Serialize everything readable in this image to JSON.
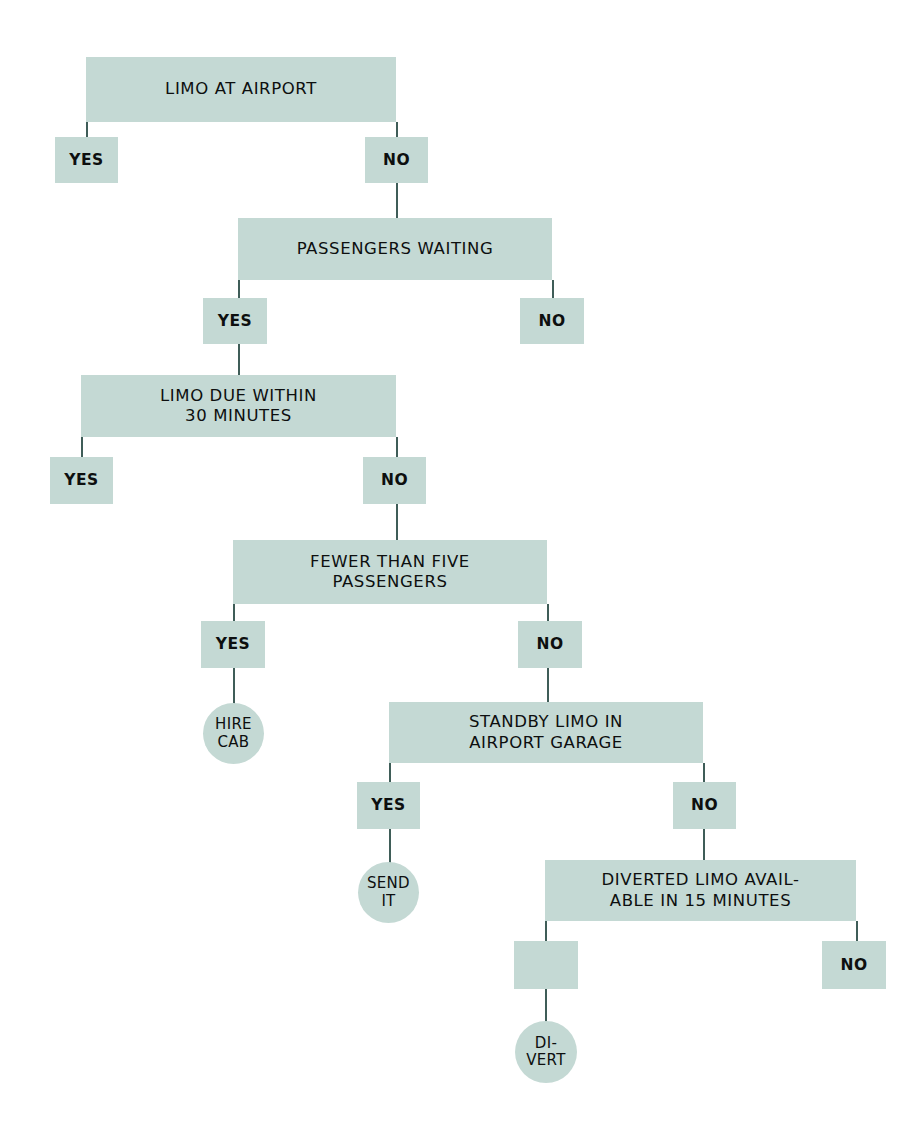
{
  "diagram": {
    "colors": {
      "node_fill": "#c4d9d4",
      "connector": "#3f5d58",
      "text": "#0d0f0f",
      "background": "#ffffff"
    },
    "nodes": [
      {
        "id": "q1",
        "kind": "question",
        "text": "LIMO AT AIRPORT",
        "x": 86,
        "y": 57,
        "w": 310,
        "h": 65
      },
      {
        "id": "q1-yes",
        "kind": "chip",
        "text": "YES",
        "x": 55,
        "y": 137,
        "w": 63,
        "h": 46
      },
      {
        "id": "q1-no",
        "kind": "chip",
        "text": "NO",
        "x": 365,
        "y": 137,
        "w": 63,
        "h": 46
      },
      {
        "id": "q2",
        "kind": "question",
        "text": "PASSENGERS WAITING",
        "x": 238,
        "y": 218,
        "w": 314,
        "h": 62
      },
      {
        "id": "q2-yes",
        "kind": "chip",
        "text": "YES",
        "x": 203,
        "y": 298,
        "w": 64,
        "h": 46
      },
      {
        "id": "q2-no",
        "kind": "chip",
        "text": "NO",
        "x": 520,
        "y": 298,
        "w": 64,
        "h": 46
      },
      {
        "id": "q3",
        "kind": "question",
        "text": "LIMO DUE WITHIN\n30 MINUTES",
        "x": 81,
        "y": 375,
        "w": 315,
        "h": 62
      },
      {
        "id": "q3-yes",
        "kind": "chip",
        "text": "YES",
        "x": 50,
        "y": 457,
        "w": 63,
        "h": 47
      },
      {
        "id": "q3-no",
        "kind": "chip",
        "text": "NO",
        "x": 363,
        "y": 457,
        "w": 63,
        "h": 47
      },
      {
        "id": "q4",
        "kind": "question",
        "text": "FEWER THAN FIVE\nPASSENGERS",
        "x": 233,
        "y": 540,
        "w": 314,
        "h": 64
      },
      {
        "id": "q4-yes",
        "kind": "chip",
        "text": "YES",
        "x": 201,
        "y": 621,
        "w": 64,
        "h": 47
      },
      {
        "id": "q4-no",
        "kind": "chip",
        "text": "NO",
        "x": 518,
        "y": 621,
        "w": 64,
        "h": 47
      },
      {
        "id": "t-hire-cab",
        "kind": "terminal",
        "text": "HIRE\nCAB",
        "x": 203,
        "y": 703,
        "w": 61,
        "h": 61
      },
      {
        "id": "q5",
        "kind": "question",
        "text": "STANDBY LIMO IN\nAIRPORT GARAGE",
        "x": 389,
        "y": 702,
        "w": 314,
        "h": 61
      },
      {
        "id": "q5-yes",
        "kind": "chip",
        "text": "YES",
        "x": 357,
        "y": 782,
        "w": 63,
        "h": 47
      },
      {
        "id": "q5-no",
        "kind": "chip",
        "text": "NO",
        "x": 673,
        "y": 782,
        "w": 63,
        "h": 47
      },
      {
        "id": "t-send-it",
        "kind": "terminal",
        "text": "SEND\nIT",
        "x": 358,
        "y": 862,
        "w": 61,
        "h": 61
      },
      {
        "id": "q6",
        "kind": "question",
        "text": "DIVERTED LIMO AVAIL-\nABLE IN 15 MINUTES",
        "x": 545,
        "y": 860,
        "w": 311,
        "h": 61
      },
      {
        "id": "q6-yes",
        "kind": "chip",
        "text": "",
        "x": 514,
        "y": 941,
        "w": 64,
        "h": 48
      },
      {
        "id": "q6-no",
        "kind": "chip",
        "text": "NO",
        "x": 822,
        "y": 941,
        "w": 64,
        "h": 48
      },
      {
        "id": "t-divert",
        "kind": "terminal",
        "text": "DI-\nVERT",
        "x": 515,
        "y": 1021,
        "w": 62,
        "h": 62
      }
    ],
    "connectors": [
      {
        "id": "c-q1-yes",
        "x": 86,
        "y": 122,
        "h": 18
      },
      {
        "id": "c-q1-no",
        "x": 396,
        "y": 122,
        "h": 18
      },
      {
        "id": "c-no1-q2",
        "x": 396,
        "y": 183,
        "h": 37
      },
      {
        "id": "c-q2-yes",
        "x": 238,
        "y": 280,
        "h": 20
      },
      {
        "id": "c-q2-no",
        "x": 552,
        "y": 280,
        "h": 20
      },
      {
        "id": "c-yes2-q3",
        "x": 238,
        "y": 344,
        "h": 33
      },
      {
        "id": "c-q3-yes",
        "x": 81,
        "y": 437,
        "h": 22
      },
      {
        "id": "c-q3-no",
        "x": 396,
        "y": 437,
        "h": 22
      },
      {
        "id": "c-no3-q4",
        "x": 396,
        "y": 504,
        "h": 38
      },
      {
        "id": "c-q4-yes",
        "x": 233,
        "y": 604,
        "h": 19
      },
      {
        "id": "c-q4-no",
        "x": 547,
        "y": 604,
        "h": 19
      },
      {
        "id": "c-yes4-cab",
        "x": 233,
        "y": 668,
        "h": 37
      },
      {
        "id": "c-no4-q5",
        "x": 547,
        "y": 668,
        "h": 36
      },
      {
        "id": "c-q5-yes",
        "x": 389,
        "y": 763,
        "h": 21
      },
      {
        "id": "c-q5-no",
        "x": 703,
        "y": 763,
        "h": 21
      },
      {
        "id": "c-yes5-send",
        "x": 389,
        "y": 829,
        "h": 35
      },
      {
        "id": "c-no5-q6",
        "x": 703,
        "y": 829,
        "h": 33
      },
      {
        "id": "c-q6-yes",
        "x": 545,
        "y": 921,
        "h": 22
      },
      {
        "id": "c-q6-no",
        "x": 856,
        "y": 921,
        "h": 22
      },
      {
        "id": "c-yes6-div",
        "x": 545,
        "y": 989,
        "h": 34
      }
    ]
  }
}
